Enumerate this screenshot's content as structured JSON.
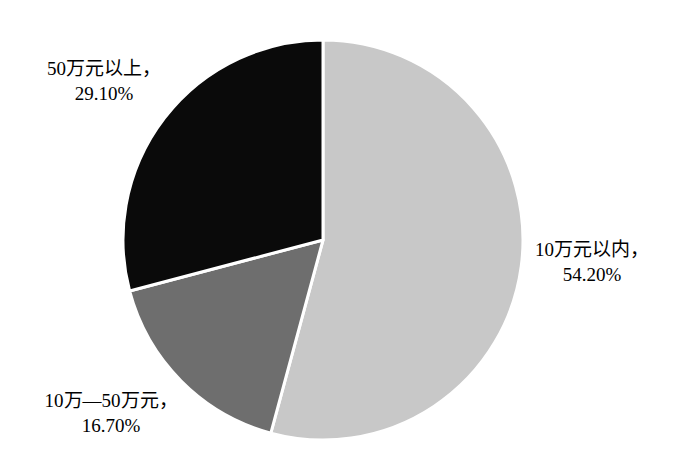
{
  "chart_data": {
    "type": "pie",
    "title": "",
    "subtitle": "",
    "xlabel": "",
    "ylabel": "",
    "legend_position": "none",
    "grid": false,
    "start_angle_deg": 0,
    "direction": "clockwise",
    "categories": [
      "10万元以内",
      "10万—50万元",
      "50万元以上"
    ],
    "values": [
      54.2,
      16.7,
      29.1
    ],
    "value_labels": [
      "54.20%",
      "16.70%",
      "29.10%"
    ],
    "colors": [
      "#c8c8c8",
      "#6e6e6e",
      "#0a0a0a"
    ],
    "slices": [
      {
        "category": "10万元以内",
        "value": 54.2,
        "value_label": "54.20%",
        "color": "#c8c8c8",
        "label_line1": "10万元以内，",
        "label_line2": "54.20%"
      },
      {
        "category": "10万—50万元",
        "value": 16.7,
        "value_label": "16.70%",
        "color": "#6e6e6e",
        "label_line1": "10万—50万元，",
        "label_line2": "16.70%"
      },
      {
        "category": "50万元以上",
        "value": 29.1,
        "value_label": "29.10%",
        "color": "#0a0a0a",
        "label_line1": "50万元以上，",
        "label_line2": "29.10%"
      }
    ]
  },
  "style": {
    "background": "#ffffff",
    "text_color": "#000000",
    "divider_color": "#ffffff"
  }
}
